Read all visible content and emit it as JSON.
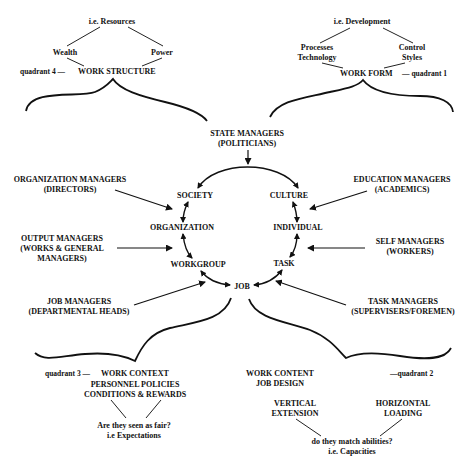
{
  "diagram": {
    "quadrant4": {
      "top": "i.e. Resources",
      "left": "Wealth",
      "right": "Power",
      "quadrant_label": "quadrant 4 —",
      "title": "WORK STRUCTURE"
    },
    "quadrant1": {
      "top": "i.e. Development",
      "left_line1": "Processes",
      "left_line2": "Technology",
      "right_line1": "Control",
      "right_line2": "Styles",
      "title": "WORK FORM",
      "quadrant_label": "— quadrant 1"
    },
    "center": {
      "state_line1": "STATE MANAGERS",
      "state_line2": "(POLITICIANS)",
      "circle_nodes": {
        "society": "SOCIETY",
        "culture": "CULTURE",
        "organization": "ORGANIZATION",
        "individual": "INDIVIDUAL",
        "workgroup": "WORKGROUP",
        "task": "TASK",
        "job": "JOB"
      }
    },
    "managers_left": [
      {
        "line1": "ORGANIZATION MANAGERS",
        "line2": "(DIRECTORS)",
        "line3": ""
      },
      {
        "line1": "OUTPUT MANAGERS",
        "line2": "(WORKS & GENERAL",
        "line3": "MANAGERS)"
      },
      {
        "line1": "JOB MANAGERS",
        "line2": "(DEPARTMENTAL HEADS)",
        "line3": ""
      }
    ],
    "managers_right": [
      {
        "line1": "EDUCATION MANAGERS",
        "line2": "(ACADEMICS)"
      },
      {
        "line1": "SELF MANAGERS",
        "line2": "(WORKERS)"
      },
      {
        "line1": "TASK MANAGERS",
        "line2": "(SUPERVISERS/FOREMEN)"
      }
    ],
    "quadrant3": {
      "quadrant_label": "quadrant 3 —",
      "title": "WORK CONTEXT",
      "sub_line1": "PERSONNEL POLICIES",
      "sub_line2": "CONDITIONS & REWARDS",
      "question": "Are they seen as fair?",
      "note": "i.e Expectations"
    },
    "quadrant2": {
      "title": "WORK CONTENT",
      "quadrant_label": "—quadrant 2",
      "sub": "JOB DESIGN",
      "left_line1": "VERTICAL",
      "left_line2": "EXTENSION",
      "right_line1": "HORIZONTAL",
      "right_line2": "LOADING",
      "question": "do they match abilities?",
      "note": "i.e. Capacities"
    }
  }
}
